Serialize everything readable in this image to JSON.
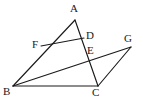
{
  "figure": {
    "type": "geometry-diagram",
    "background_color": "#ffffff",
    "stroke_color": "#1a1a1a",
    "canvas": {
      "width": 143,
      "height": 101
    }
  },
  "points": {
    "A": {
      "label": "A",
      "x": 75,
      "y": 20,
      "label_x": 70,
      "label_y": 3
    },
    "B": {
      "label": "B",
      "x": 13,
      "y": 86,
      "label_x": 3,
      "label_y": 86
    },
    "C": {
      "label": "C",
      "x": 98,
      "y": 86,
      "label_x": 92,
      "label_y": 87
    },
    "D": {
      "label": "D",
      "x": 84,
      "y": 38,
      "label_x": 86,
      "label_y": 30
    },
    "E": {
      "label": "E",
      "x": 88,
      "y": 52,
      "label_x": 87,
      "label_y": 45
    },
    "F": {
      "label": "F",
      "x": 41,
      "y": 46,
      "label_x": 32,
      "label_y": 39
    },
    "G": {
      "label": "G",
      "x": 131,
      "y": 47,
      "label_x": 124,
      "label_y": 33
    }
  },
  "segments": [
    {
      "name": "segment-A-B",
      "from": "A",
      "to": "B"
    },
    {
      "name": "segment-A-C",
      "from": "A",
      "to": "C"
    },
    {
      "name": "segment-B-C",
      "from": "B",
      "to": "C"
    },
    {
      "name": "segment-F-D",
      "from": "F",
      "to": "D"
    },
    {
      "name": "segment-B-G",
      "from": "B",
      "to": "G"
    },
    {
      "name": "segment-C-G",
      "from": "C",
      "to": "G"
    }
  ]
}
